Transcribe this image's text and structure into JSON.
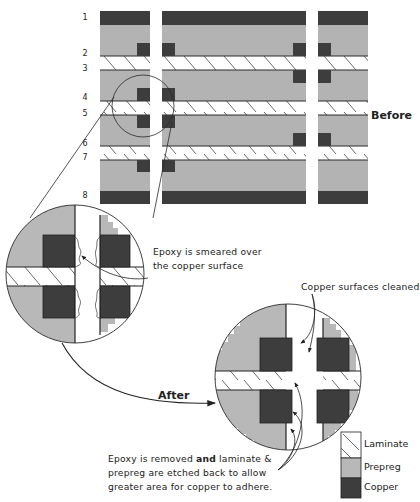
{
  "colors": {
    "copper": "#3d3d3d",
    "prepreg": "#b3b3b3",
    "laminate": "#ffffff",
    "line": "#2a2a2a"
  },
  "layer_numbers": [
    "1",
    "2",
    "3",
    "4",
    "5",
    "6",
    "7",
    "8"
  ],
  "labels": {
    "before": "Before",
    "after": "After"
  },
  "annotations": {
    "epoxy_smeared": [
      "Epoxy is smeared over",
      "the copper surface"
    ],
    "copper_cleaned": "Copper surfaces cleaned",
    "epoxy_removed": {
      "line1_a": "Epoxy is removed ",
      "line1_b": "and",
      "line1_c": " laminate &",
      "line2": "prepreg are etched back to allow",
      "line3": "greater area for copper to adhere."
    }
  },
  "legend": [
    {
      "label": "Laminate",
      "material": "laminate"
    },
    {
      "label": "Prepreg",
      "material": "prepreg"
    },
    {
      "label": "Copper",
      "material": "copper"
    }
  ]
}
